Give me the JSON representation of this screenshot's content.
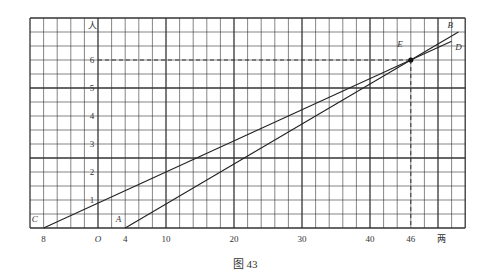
{
  "figure": {
    "caption": "图 43",
    "y_axis_unit": "人",
    "x_axis_unit": "两",
    "origin_label": "O"
  },
  "chart_data": {
    "type": "line",
    "title": "图 43",
    "xlabel": "两",
    "ylabel": "人",
    "xlim": [
      -10,
      54
    ],
    "ylim": [
      0,
      7.5
    ],
    "grid": true,
    "x_ticks": [
      {
        "value": -8,
        "label": "8"
      },
      {
        "value": 0,
        "label": "O"
      },
      {
        "value": 4,
        "label": "4"
      },
      {
        "value": 10,
        "label": "10"
      },
      {
        "value": 20,
        "label": "20"
      },
      {
        "value": 30,
        "label": "30"
      },
      {
        "value": 40,
        "label": "40"
      },
      {
        "value": 46,
        "label": "46"
      }
    ],
    "y_ticks": [
      1,
      2,
      3,
      4,
      5,
      6
    ],
    "series": [
      {
        "name": "AB",
        "points": [
          [
            4,
            0
          ],
          [
            46,
            6
          ],
          [
            53,
            7
          ]
        ],
        "start_label": "A",
        "end_label": "B"
      },
      {
        "name": "CD",
        "points": [
          [
            -8,
            0
          ],
          [
            46,
            6
          ],
          [
            52,
            6.667
          ]
        ],
        "start_label": "C",
        "end_label": "D"
      }
    ],
    "annotations": [
      {
        "label": "E",
        "point": [
          46,
          6
        ],
        "note": "intersection, dashed guides to axes"
      }
    ]
  },
  "geometry": {
    "px_per_x": 6.8,
    "px_per_y": 28,
    "origin_px": [
      98,
      228
    ],
    "x_min": -10,
    "x_max": 54,
    "y_max": 7.5
  }
}
